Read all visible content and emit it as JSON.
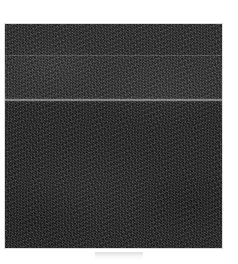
{
  "page": {
    "label": "scanned-grayscale-plate",
    "background_color": "#ffffff",
    "width": 238,
    "height": 264
  },
  "plate": {
    "label": "dark-textured-scan-region",
    "description": "Heavily grained dark rectangular scanned image region occupying most of the frame",
    "base_color": "#2b2b2b",
    "border_color": "#8c8c8c",
    "bounds": {
      "left": 5,
      "top": 24,
      "width": 217,
      "height": 224
    },
    "bands": [
      {
        "name": "upper-band",
        "tone": "dark",
        "top": 0,
        "height": 31
      },
      {
        "name": "middle-band",
        "tone": "slightly-lighter",
        "top": 31,
        "height": 45
      },
      {
        "name": "lower-band",
        "tone": "darkest",
        "top": 76,
        "height": 148
      }
    ],
    "seams": [
      {
        "name": "upper-seam",
        "top": 31,
        "thickness": 1,
        "tone": "faint-light"
      },
      {
        "name": "lower-seam",
        "top": 75,
        "thickness": 2,
        "tone": "bright-light"
      }
    ]
  },
  "caption": {
    "label": "faint-caption-artifact",
    "text": "",
    "visible_as": "very faint light-gray smudge, no legible characters",
    "color": "#afafaf"
  }
}
